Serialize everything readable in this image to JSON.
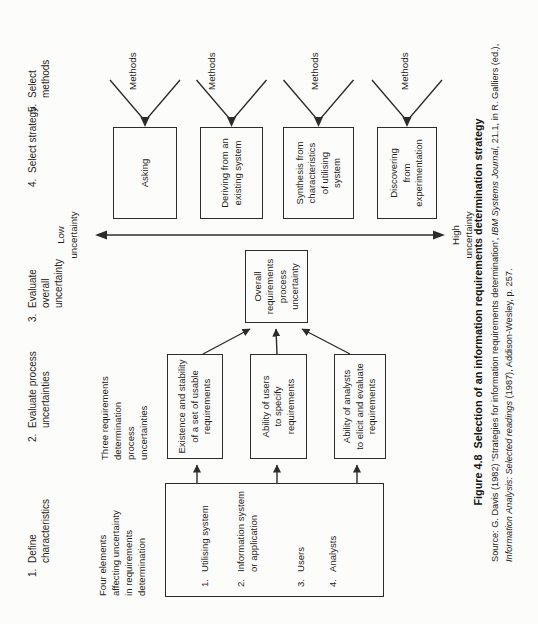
{
  "figure": {
    "colors": {
      "ink": "#2c2c2c",
      "paper": "#fcfcfa"
    },
    "steps": [
      {
        "num": "1.",
        "text": "Define\ncharacteristics"
      },
      {
        "num": "2.",
        "text": "Evaluate process\nuncertainties"
      },
      {
        "num": "3.",
        "text": "Evaluate\noverall\nuncertainty"
      },
      {
        "num": "4.",
        "text": "Select strategy"
      },
      {
        "num": "5.",
        "text": "Select\nmethods"
      }
    ],
    "four_elements": {
      "label": "Four elements\naffecting uncertainty\nin requirements\ndetermination",
      "items": [
        {
          "num": "1.",
          "text": "Utilising system"
        },
        {
          "num": "2.",
          "text": "Information system\nor application"
        },
        {
          "num": "3.",
          "text": "Users"
        },
        {
          "num": "4.",
          "text": "Analysts"
        }
      ]
    },
    "process_uncertainties": {
      "label": "Three requirements\ndetermination\nprocess\nuncertainties",
      "boxes": [
        "Existence and stability\nof a set of usable\nrequirements",
        "Ability of users\nto specify\nrequirements",
        "Ability of analysts\nto elicit and evaluate\nrequirements"
      ]
    },
    "overall_box": "Overall\nrequirements\nprocess\nuncertainty",
    "scale": {
      "low": "Low\nuncertainty",
      "high": "High\nuncertainty"
    },
    "strategies": [
      {
        "label": "Asking",
        "methods": "Methods"
      },
      {
        "label": "Deriving from an\nexisting system",
        "methods": "Methods"
      },
      {
        "label": "Synthesis from\ncharacteristics\nof utilising\nsystem",
        "methods": "Methods"
      },
      {
        "label": "Discovering\nfrom\nexperimentation",
        "methods": "Methods"
      }
    ],
    "caption": {
      "title": "Figure 4.8  Selection of an information requirements determination strategy",
      "src1_a": "Source: G. Davis (1982) 'Strategies for information requirements determination', ",
      "src1_em": "IBM Systems Journal",
      "src1_b": ", 21.1, in R. Galliers (ed.),",
      "src2_em": "Information Analysis: Selected readings",
      "src2_b": " (1987), Addison-Wesley, p. 257."
    }
  }
}
